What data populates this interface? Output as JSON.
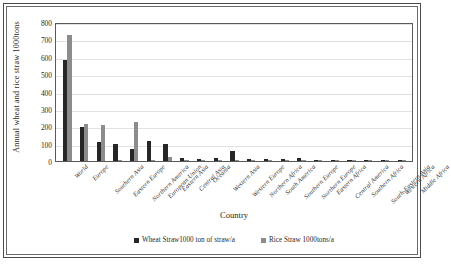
{
  "chart_data": {
    "type": "bar",
    "title": "",
    "xlabel": "Country",
    "ylabel": "Annual  wheat and rice straw  1000tons",
    "ylim": [
      0,
      800
    ],
    "yticks": [
      0,
      100,
      200,
      300,
      400,
      500,
      600,
      700,
      800
    ],
    "grid": true,
    "legend_position": "bottom",
    "categories": [
      "World",
      "Europe",
      "Southern Asia",
      "Eastern Europe",
      "Northern America",
      "European Union",
      "Eastern Asia",
      "Central Asia",
      "Oceania",
      "Western Asia",
      "Western Europe",
      "Northern Africa",
      "South America",
      "Southern Europe",
      "Northern Europe",
      "Eastern Africa",
      "Central America",
      "Southern Africa",
      "South-Eastern Asia",
      "Western Africa",
      "Middle Africa"
    ],
    "series": [
      {
        "name": "Wheat Straw1000 ton of straw/a",
        "color": "#262626",
        "values": [
          583,
          194,
          107,
          100,
          71,
          117,
          97,
          18,
          14,
          19,
          57,
          13,
          13,
          9,
          18,
          2,
          1,
          1,
          1,
          1,
          1
        ]
      },
      {
        "name": "Rice Straw 1000tons/a",
        "color": "#8c8c8c",
        "values": [
          726,
          213,
          210,
          2,
          226,
          6,
          22,
          1,
          1,
          1,
          1,
          2,
          4,
          1,
          1,
          1,
          1,
          1,
          4,
          1,
          1
        ]
      }
    ]
  },
  "legend": {
    "entries": [
      {
        "label": "Wheat Straw1000 ton of straw/a",
        "color": "#262626",
        "swatch": "square-marker-icon"
      },
      {
        "label": "Rice Straw 1000tons/a",
        "color": "#8c8c8c",
        "swatch": "square-marker-icon"
      }
    ]
  }
}
